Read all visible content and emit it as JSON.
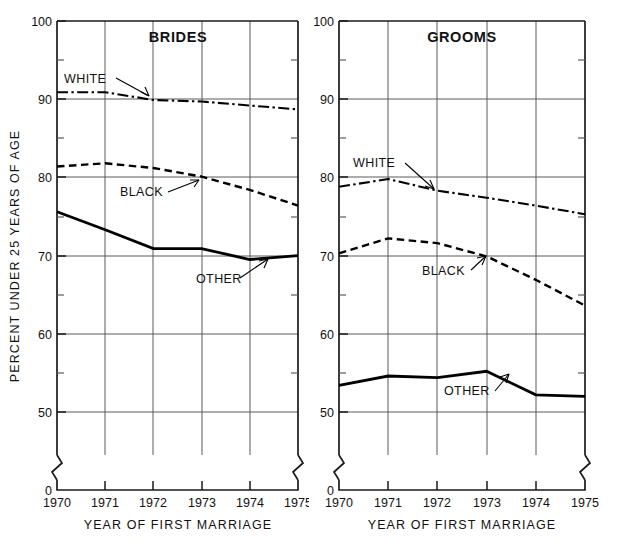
{
  "figure": {
    "ylabel": "PERCENT UNDER 25 YEARS OF AGE"
  },
  "panels": [
    {
      "key": "brides",
      "title": "BRIDES",
      "xlabel": "YEAR OF FIRST MARRIAGE",
      "labels": {
        "white": "WHITE",
        "black": "BLACK",
        "other": "OTHER"
      }
    },
    {
      "key": "grooms",
      "title": "GROOMS",
      "xlabel": "YEAR OF FIRST MARRIAGE",
      "labels": {
        "white": "WHITE",
        "black": "BLACK",
        "other": "OTHER"
      }
    }
  ],
  "axis": {
    "y_ticks": [
      "100",
      "90",
      "80",
      "70",
      "60",
      "50",
      "0"
    ],
    "x_ticks": [
      "1970",
      "1971",
      "1972",
      "1973",
      "1974",
      "1975"
    ]
  },
  "chart_data": [
    {
      "type": "line",
      "title": "BRIDES",
      "xlabel": "YEAR OF FIRST MARRIAGE",
      "ylabel": "PERCENT UNDER 25 YEARS OF AGE",
      "x": [
        1970,
        1971,
        1972,
        1973,
        1974,
        1975
      ],
      "ylim": [
        50,
        100
      ],
      "xlim": [
        1970,
        1975
      ],
      "grid": true,
      "legend": "inline-annotations",
      "series": [
        {
          "name": "WHITE",
          "style": "dash-dot",
          "values": [
            90.9,
            90.9,
            89.9,
            89.7,
            89.2,
            88.7
          ]
        },
        {
          "name": "BLACK",
          "style": "dashed",
          "values": [
            81.4,
            81.8,
            81.2,
            80.1,
            78.4,
            76.4
          ]
        },
        {
          "name": "OTHER",
          "style": "solid",
          "values": [
            75.6,
            73.3,
            70.9,
            70.9,
            69.5,
            70.0
          ]
        }
      ]
    },
    {
      "type": "line",
      "title": "GROOMS",
      "xlabel": "YEAR OF FIRST MARRIAGE",
      "ylabel": "PERCENT UNDER 25 YEARS OF AGE",
      "x": [
        1970,
        1971,
        1972,
        1973,
        1974,
        1975
      ],
      "ylim": [
        50,
        100
      ],
      "xlim": [
        1970,
        1975
      ],
      "grid": true,
      "legend": "inline-annotations",
      "series": [
        {
          "name": "WHITE",
          "style": "dash-dot",
          "values": [
            78.8,
            79.8,
            78.3,
            77.4,
            76.4,
            75.3
          ]
        },
        {
          "name": "BLACK",
          "style": "dashed",
          "values": [
            70.3,
            72.2,
            71.6,
            69.9,
            66.9,
            63.6
          ]
        },
        {
          "name": "OTHER",
          "style": "solid",
          "values": [
            53.4,
            54.6,
            54.4,
            55.2,
            52.2,
            52.0
          ]
        }
      ]
    }
  ]
}
